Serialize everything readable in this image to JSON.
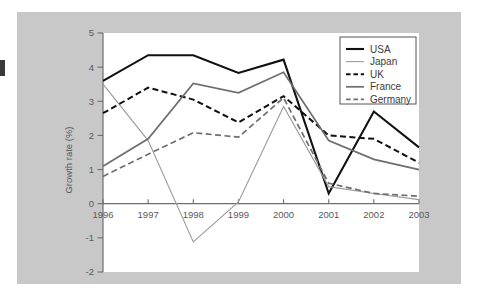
{
  "chart_data": {
    "type": "line",
    "title": "",
    "xlabel": "",
    "ylabel": "Growth rate (%)",
    "categories": [
      "1996",
      "1997",
      "1998",
      "1999",
      "2000",
      "2001",
      "2002",
      "2003"
    ],
    "x": [
      1996,
      1997,
      1998,
      1999,
      2000,
      2001,
      2002,
      2003
    ],
    "xlim": [
      1996,
      2003
    ],
    "ylim": [
      -2,
      5
    ],
    "ytick_labels": [
      "5",
      "4",
      "3",
      "2",
      "1",
      "0",
      "-1",
      "-2"
    ],
    "ytick_values": [
      5,
      4,
      3,
      2,
      1,
      0,
      -1,
      -2
    ],
    "grid": false,
    "legend_position": "top-right",
    "series": [
      {
        "name": "USA",
        "style": "solid",
        "color": "#111111",
        "width": 2.1,
        "values": [
          3.6,
          4.35,
          4.35,
          3.83,
          4.22,
          0.3,
          2.7,
          1.65
        ]
      },
      {
        "name": "Japan",
        "style": "solid",
        "color": "#9a9a9c",
        "width": 1.1,
        "values": [
          3.5,
          1.85,
          -1.12,
          0.05,
          2.85,
          0.5,
          0.3,
          0.12
        ]
      },
      {
        "name": "UK",
        "style": "dashed",
        "color": "#111111",
        "width": 2.0,
        "values": [
          2.65,
          3.4,
          3.05,
          2.38,
          3.15,
          2.0,
          1.9,
          1.2
        ]
      },
      {
        "name": "France",
        "style": "solid",
        "color": "#6e6e72",
        "width": 1.7,
        "values": [
          1.1,
          1.9,
          3.52,
          3.25,
          3.85,
          1.85,
          1.3,
          1.0
        ]
      },
      {
        "name": "Germany",
        "style": "dashed",
        "color": "#6e6e72",
        "width": 1.7,
        "values": [
          0.8,
          1.45,
          2.08,
          1.95,
          3.1,
          0.6,
          0.3,
          0.22
        ]
      }
    ]
  },
  "legend": {
    "entries": [
      {
        "label": "USA"
      },
      {
        "label": "Japan"
      },
      {
        "label": "UK"
      },
      {
        "label": "France"
      },
      {
        "label": "Germany"
      }
    ]
  },
  "colors": {
    "page_background": "#ffffff",
    "panel_background": "#c8c8c8",
    "plot_background": "#ffffff",
    "axis": "#6e6e6e",
    "text": "#59595c"
  }
}
